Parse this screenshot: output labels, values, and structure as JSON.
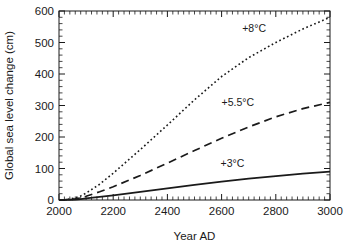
{
  "chart_data": {
    "type": "line",
    "title": "",
    "subtitle": "",
    "xlabel": "Year AD",
    "ylabel": "Global sea level change (cm)",
    "xlim": [
      2000,
      3000
    ],
    "ylim": [
      0,
      600
    ],
    "xticks": [
      2000,
      2200,
      2400,
      2600,
      2800,
      3000
    ],
    "yticks": [
      0,
      100,
      200,
      300,
      400,
      500,
      600
    ],
    "xtick_labels": [
      "2000",
      "2200",
      "2400",
      "2600",
      "2800",
      "3000"
    ],
    "ytick_labels": [
      "0",
      "100",
      "200",
      "300",
      "400",
      "500",
      "600"
    ],
    "x_minor_step": 20,
    "y_minor_step": 20,
    "grid": false,
    "legend_position": "inline-annotations",
    "ticks_direction": "inward-all-sides",
    "frame": true,
    "series": [
      {
        "name": "+8°C",
        "label": "+8°C",
        "style": "dotted",
        "color": "#1a1a1a",
        "width": 1.6,
        "dash": "1.7,2.6",
        "label_x": 2720,
        "label_y": 533,
        "x": [
          2000,
          2020,
          2040,
          2060,
          2080,
          2100,
          2150,
          2200,
          2300,
          2400,
          2500,
          2600,
          2700,
          2800,
          2900,
          3000
        ],
        "y": [
          0,
          1,
          3,
          7,
          13,
          22,
          50,
          85,
          160,
          238,
          318,
          392,
          452,
          500,
          543,
          580
        ]
      },
      {
        "name": "+5.5°C",
        "label": "+5.5°C",
        "style": "dashed",
        "color": "#1a1a1a",
        "width": 1.7,
        "dash": "8,5",
        "label_x": 2660,
        "label_y": 300,
        "x": [
          2000,
          2020,
          2040,
          2060,
          2080,
          2100,
          2150,
          2200,
          2300,
          2400,
          2500,
          2600,
          2700,
          2800,
          2900,
          3000
        ],
        "y": [
          0,
          0.5,
          1.5,
          3.5,
          7,
          12,
          26,
          42,
          78,
          117,
          157,
          196,
          232,
          264,
          290,
          310
        ]
      },
      {
        "name": "+3°C",
        "label": "+3°C",
        "style": "solid",
        "color": "#1a1a1a",
        "width": 1.8,
        "dash": "",
        "label_x": 2640,
        "label_y": 104,
        "x": [
          2000,
          2020,
          2040,
          2060,
          2080,
          2100,
          2150,
          2200,
          2300,
          2400,
          2500,
          2600,
          2700,
          2800,
          2900,
          3000
        ],
        "y": [
          0,
          0.3,
          0.8,
          1.6,
          3,
          5,
          10,
          15,
          26,
          37,
          48,
          58,
          68,
          76,
          84,
          90
        ]
      }
    ]
  },
  "plot_geometry": {
    "left": 59,
    "right": 330,
    "top": 11,
    "bottom": 200,
    "major_tick_len": 6,
    "minor_tick_len": 3.5
  },
  "colors": {
    "axis": "#1a1a1a",
    "background": "#ffffff",
    "series": "#1a1a1a"
  }
}
